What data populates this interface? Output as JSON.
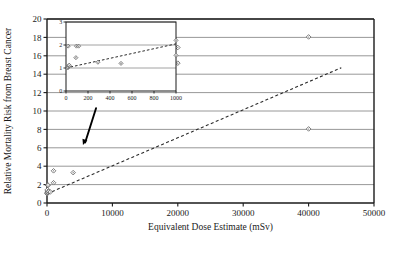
{
  "figure": {
    "background": "#ffffff",
    "axis_color": "#1a1a1a",
    "grid_color": "#8c8c8c",
    "marker_color": "#5a5a5a",
    "trend_color": "#2b2b2b",
    "arrow_color": "#000000"
  },
  "chart_data": {
    "type": "scatter",
    "title": "",
    "xlabel": "Equivalent Dose Estimate (mSv)",
    "ylabel": "Relative Mortality Risk from Breast Cancer",
    "xlim": [
      0,
      50000
    ],
    "ylim": [
      0,
      20
    ],
    "xticks": [
      0,
      10000,
      20000,
      30000,
      40000,
      50000
    ],
    "yticks": [
      0,
      2,
      4,
      6,
      8,
      10,
      12,
      14,
      16,
      18,
      20
    ],
    "xtick_labels": [
      "0",
      "10000",
      "20000",
      "30000",
      "40000",
      "50000"
    ],
    "ytick_labels": [
      "0",
      "2",
      "4",
      "6",
      "8",
      "10",
      "12",
      "14",
      "16",
      "18",
      "20"
    ],
    "grid": "horizontal",
    "legend": "none",
    "series": [
      {
        "name": "Observed relative mortality risk",
        "marker": "diamond",
        "points": [
          {
            "x": 20,
            "y": 1.0
          },
          {
            "x": 30,
            "y": 1.05
          },
          {
            "x": 40,
            "y": 1.15
          },
          {
            "x": 50,
            "y": 1.2
          },
          {
            "x": 60,
            "y": 1.35
          },
          {
            "x": 80,
            "y": 1.45
          },
          {
            "x": 100,
            "y": 1.95
          },
          {
            "x": 120,
            "y": 1.9
          },
          {
            "x": 150,
            "y": 1.95
          },
          {
            "x": 300,
            "y": 1.25
          },
          {
            "x": 500,
            "y": 1.2
          },
          {
            "x": 1000,
            "y": 2.2
          },
          {
            "x": 1000,
            "y": 3.5
          },
          {
            "x": 4000,
            "y": 3.3
          },
          {
            "x": 20000,
            "y": 15.2
          },
          {
            "x": 20000,
            "y": 16.9
          },
          {
            "x": 40000,
            "y": 8.05
          },
          {
            "x": 40000,
            "y": 18.05
          }
        ]
      }
    ],
    "trendline": {
      "name": "Linear fit (dashed)",
      "style": "dashed",
      "x_start": 0,
      "y_start": 1.0,
      "x_end": 45000,
      "y_end": 14.7
    },
    "annotations": [
      {
        "type": "arrow",
        "name": "inset-callout-arrow",
        "x_start": 7500,
        "y_start": 10.3,
        "x_end": 5500,
        "y_end": 6.3
      }
    ],
    "inset": {
      "type": "scatter",
      "xlabel": "",
      "ylabel": "",
      "xlim": [
        0,
        1000
      ],
      "ylim": [
        0,
        3
      ],
      "xticks": [
        0,
        200,
        400,
        600,
        800,
        1000
      ],
      "yticks": [
        0,
        1,
        2,
        3
      ],
      "xtick_labels": [
        "0",
        "200",
        "400",
        "600",
        "800",
        "1000"
      ],
      "ytick_labels": [
        "0",
        "1",
        "2",
        "3"
      ],
      "grid": "horizontal",
      "series": [
        {
          "name": "Low-dose detail",
          "marker": "diamond",
          "points": [
            {
              "x": 15,
              "y": 1.0
            },
            {
              "x": 20,
              "y": 1.05
            },
            {
              "x": 25,
              "y": 1.1
            },
            {
              "x": 30,
              "y": 1.12
            },
            {
              "x": 20,
              "y": 1.95
            },
            {
              "x": 95,
              "y": 1.95
            },
            {
              "x": 115,
              "y": 1.95
            },
            {
              "x": 90,
              "y": 1.45
            },
            {
              "x": 290,
              "y": 1.25
            },
            {
              "x": 500,
              "y": 1.2
            },
            {
              "x": 1000,
              "y": 2.2
            },
            {
              "x": 1000,
              "y": 1.55
            }
          ]
        }
      ],
      "trendline": {
        "style": "dashed",
        "x_start": 0,
        "y_start": 1.0,
        "x_end": 1000,
        "y_end": 2.05
      }
    }
  }
}
